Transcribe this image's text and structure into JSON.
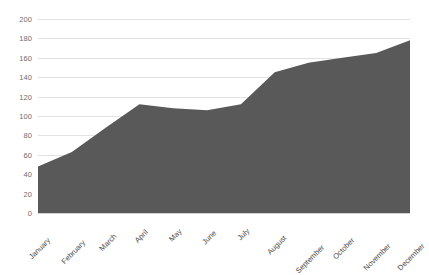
{
  "chart_data": {
    "type": "area",
    "title": "",
    "subtitle": "",
    "xlabel": "",
    "ylabel": "",
    "categories": [
      "January",
      "February",
      "March",
      "April",
      "May",
      "June",
      "July",
      "August",
      "September",
      "October",
      "November",
      "December"
    ],
    "values": [
      48,
      63,
      88,
      112,
      108,
      106,
      112,
      145,
      155,
      160,
      165,
      178
    ],
    "series": [
      {
        "name": "Series 1",
        "values": [
          48,
          63,
          88,
          112,
          108,
          106,
          112,
          145,
          155,
          160,
          165,
          178
        ]
      }
    ],
    "ylim": [
      0,
      200
    ],
    "y_ticks": [
      0,
      20,
      40,
      60,
      80,
      100,
      120,
      140,
      160,
      180,
      200
    ],
    "y_tick_labels": [
      "0",
      "20",
      "40",
      "60",
      "80",
      "100",
      "120",
      "140",
      "160",
      "180",
      "200"
    ],
    "grid": true,
    "legend": false,
    "legend_position": "none",
    "colors": {
      "area_fill": "#595959",
      "gridline": "#e2e2e2",
      "baseline": "#d0d0d0",
      "axis_text": "#4a4a4a",
      "y_axis_text": "#6d6d6d",
      "background": "#ffffff"
    }
  }
}
